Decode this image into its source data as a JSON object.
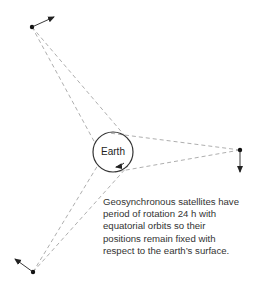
{
  "diagram": {
    "earth": {
      "label": "Earth",
      "cx": 113,
      "cy": 152,
      "r": 20
    },
    "satellites": [
      {
        "name": "satellite-top",
        "x": 32,
        "y": 27,
        "arrow_to": [
          56,
          16
        ]
      },
      {
        "name": "satellite-right",
        "x": 240,
        "y": 150,
        "arrow_to": [
          240,
          175
        ]
      },
      {
        "name": "satellite-bottom",
        "x": 33,
        "y": 272,
        "arrow_to": [
          14,
          258
        ]
      }
    ],
    "colors": {
      "line": "#999999",
      "ink": "#222222",
      "text": "#333333"
    }
  },
  "caption": {
    "lines": [
      "Geosynchronous satellites have",
      "period of rotation 24 h with",
      "equatorial orbits so their",
      "positions remain fixed with",
      "respect to the earth’s surface."
    ]
  }
}
